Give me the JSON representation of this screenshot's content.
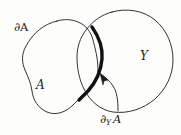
{
  "figure": {
    "background_color": "#fdfdfc",
    "ink_color": "#1c1c1c",
    "labels": {
      "boundary_of_A": "∂A",
      "set_A": "A",
      "set_Y": "Y",
      "relative_boundary_operator": "∂",
      "relative_boundary_subscript": "Y",
      "relative_boundary_argument": "A"
    },
    "regions": [
      {
        "name": "set-A-region",
        "label": "A",
        "description": "left rounded blob outlined with a thin curve"
      },
      {
        "name": "set-Y-region",
        "label": "Y",
        "description": "right rounded blob outlined with a thin curve"
      }
    ],
    "curves": [
      {
        "name": "thin-outline",
        "stroke_width": 0.9,
        "color": "#1c1c1c"
      },
      {
        "name": "relative-boundary-arc",
        "stroke_width": 3.4,
        "color": "#121212",
        "description": "thick arc inside the overlap marking ∂_Y A"
      },
      {
        "name": "annotation-arrow",
        "stroke_width": 0.9,
        "color": "#1c1c1c",
        "description": "curved leader line with arrowhead from the ∂_Y A label to the thick arc"
      }
    ]
  }
}
